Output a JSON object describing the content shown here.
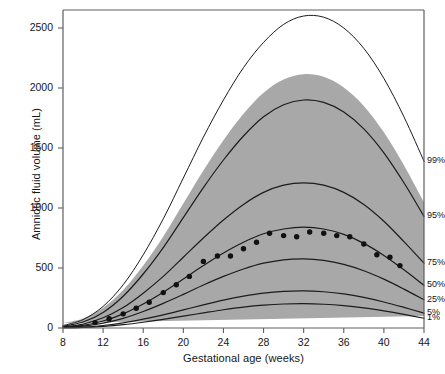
{
  "chart_data": {
    "type": "line",
    "title": "",
    "xlabel": "Gestational age (weeks)",
    "ylabel": "Amniotic fluid volume (mL)",
    "xlim": [
      8,
      44
    ],
    "ylim": [
      0,
      2650
    ],
    "xticks": [
      8,
      12,
      16,
      20,
      24,
      28,
      32,
      36,
      40,
      44
    ],
    "yticks": [
      0,
      500,
      1000,
      1500,
      2000,
      2500
    ],
    "grid": false,
    "legend_position": "right-inline",
    "shaded_band": {
      "label": "gray normal range band",
      "color": "#a8a8a8",
      "upper_percentile": "95%",
      "lower_percentile": "5%"
    },
    "x": [
      8,
      10,
      12,
      14,
      16,
      18,
      20,
      22,
      24,
      26,
      28,
      30,
      32,
      34,
      36,
      38,
      40,
      42,
      44
    ],
    "series": [
      {
        "name": "99%",
        "label": "99%",
        "values": [
          20,
          70,
          180,
          360,
          610,
          910,
          1250,
          1590,
          1900,
          2170,
          2380,
          2530,
          2600,
          2590,
          2500,
          2330,
          2080,
          1760,
          1390
        ]
      },
      {
        "name": "95%",
        "label": "95%",
        "values": [
          15,
          50,
          130,
          265,
          450,
          670,
          920,
          1170,
          1400,
          1600,
          1760,
          1860,
          1900,
          1880,
          1800,
          1660,
          1460,
          1210,
          930
        ]
      },
      {
        "name": "75%",
        "label": "75%",
        "values": [
          10,
          33,
          85,
          170,
          290,
          430,
          590,
          750,
          900,
          1030,
          1130,
          1190,
          1210,
          1190,
          1130,
          1030,
          890,
          720,
          540
        ]
      },
      {
        "name": "50%",
        "label": "50%",
        "values": [
          7,
          22,
          58,
          118,
          200,
          298,
          408,
          520,
          625,
          715,
          785,
          825,
          840,
          825,
          780,
          705,
          605,
          485,
          355
        ]
      },
      {
        "name": "25%",
        "label": "25%",
        "values": [
          5,
          15,
          40,
          80,
          137,
          205,
          280,
          358,
          430,
          492,
          540,
          568,
          576,
          563,
          530,
          477,
          407,
          324,
          235
        ]
      },
      {
        "name": "5%",
        "label": "5%",
        "values": [
          3,
          8,
          21,
          43,
          74,
          110,
          151,
          193,
          232,
          265,
          291,
          306,
          310,
          302,
          284,
          255,
          217,
          172,
          124
        ]
      },
      {
        "name": "1%",
        "label": "1%",
        "values": [
          2,
          5,
          14,
          28,
          48,
          72,
          99,
          126,
          152,
          174,
          190,
          200,
          203,
          198,
          186,
          167,
          142,
          113,
          81
        ]
      }
    ],
    "points": {
      "name": "observed median measurements",
      "marker": "filled-circle",
      "color": "#111111",
      "data": [
        {
          "x": 11.2,
          "y": 45
        },
        {
          "x": 12.6,
          "y": 78
        },
        {
          "x": 14.0,
          "y": 118
        },
        {
          "x": 15.3,
          "y": 165
        },
        {
          "x": 16.6,
          "y": 215
        },
        {
          "x": 18.0,
          "y": 295
        },
        {
          "x": 19.3,
          "y": 360
        },
        {
          "x": 20.6,
          "y": 430
        },
        {
          "x": 22.0,
          "y": 555
        },
        {
          "x": 23.4,
          "y": 600
        },
        {
          "x": 24.7,
          "y": 600
        },
        {
          "x": 26.0,
          "y": 660
        },
        {
          "x": 27.3,
          "y": 715
        },
        {
          "x": 28.6,
          "y": 790
        },
        {
          "x": 30.0,
          "y": 770
        },
        {
          "x": 31.3,
          "y": 760
        },
        {
          "x": 32.6,
          "y": 800
        },
        {
          "x": 34.0,
          "y": 790
        },
        {
          "x": 35.3,
          "y": 770
        },
        {
          "x": 36.6,
          "y": 760
        },
        {
          "x": 38.0,
          "y": 700
        },
        {
          "x": 39.3,
          "y": 610
        },
        {
          "x": 40.6,
          "y": 590
        },
        {
          "x": 41.6,
          "y": 520
        }
      ]
    }
  },
  "axis": {
    "x_title": "Gestational age (weeks)",
    "y_title": "Amniotic fluid volume (mL)",
    "x_tick_labels": [
      "8",
      "12",
      "16",
      "20",
      "24",
      "28",
      "32",
      "36",
      "40",
      "44"
    ],
    "y_tick_labels": [
      "0",
      "500",
      "1000",
      "1500",
      "2000",
      "2500"
    ]
  },
  "percentile_labels": [
    "99%",
    "95%",
    "75%",
    "50%",
    "25%",
    "5%",
    "1%"
  ],
  "colors": {
    "band": "#a8a8a8",
    "curve": "#1c1c1c",
    "frame": "#5e5e5e",
    "marker": "#111111",
    "text": "#161616"
  }
}
